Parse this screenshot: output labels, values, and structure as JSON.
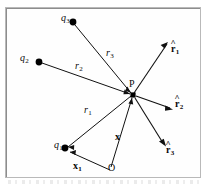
{
  "figure": {
    "frame": {
      "stroke": "#b9b9b9",
      "inner_stroke": "#8d8d8d",
      "background": "#fefefe"
    },
    "line_color": "#111111",
    "dot_color": "#000000"
  },
  "labels": {
    "q1": {
      "base": "q",
      "sub": "1",
      "x": 55,
      "y": 142
    },
    "q2": {
      "base": "q",
      "sub": "2",
      "x": 20,
      "y": 56
    },
    "q3": {
      "base": "q",
      "sub": "3",
      "x": 61,
      "y": 13
    },
    "r1": {
      "base": "r",
      "sub": "1",
      "x": 84,
      "y": 107
    },
    "r2": {
      "base": "r",
      "sub": "2",
      "x": 75,
      "y": 64
    },
    "r3": {
      "base": "r",
      "sub": "3",
      "x": 107,
      "y": 50
    },
    "rhat1": {
      "base": "r",
      "sub": "1",
      "hat": "^",
      "x": 173,
      "y": 48
    },
    "rhat2": {
      "base": "r",
      "sub": "2",
      "hat": "^",
      "x": 176,
      "y": 102
    },
    "rhat3": {
      "base": "r",
      "sub": "3",
      "hat": "^",
      "x": 168,
      "y": 148
    },
    "x_vec": {
      "base": "x",
      "sub": "",
      "x": 115,
      "y": 135
    },
    "x1_vec": {
      "base": "x",
      "sub": "1",
      "x": 74,
      "y": 163
    },
    "P": {
      "base": "P",
      "x": 129,
      "y": 82
    },
    "O": {
      "base": "O",
      "x": 108,
      "y": 164
    }
  },
  "points": {
    "P": {
      "x": 133,
      "y": 95,
      "label": "P",
      "radius": 2.6
    },
    "O": {
      "x": 112,
      "y": 171,
      "label": "O"
    },
    "q1": {
      "x": 65,
      "y": 148,
      "label": "q1",
      "radius": 3.2
    },
    "q2": {
      "x": 39,
      "y": 62,
      "label": "q2",
      "radius": 3.2
    },
    "q3": {
      "x": 73,
      "y": 22,
      "label": "q3",
      "radius": 3.2
    }
  },
  "vectors": [
    {
      "name": "r1",
      "from": "q1",
      "to": "P",
      "arrow_at": "q1",
      "label": "r1"
    },
    {
      "name": "r2",
      "from": "q2",
      "to": "P",
      "arrow_at": "P",
      "label": "r2"
    },
    {
      "name": "r3",
      "from": "q3",
      "to": "P",
      "arrow_at": "P",
      "label": "r3"
    },
    {
      "name": "rhat1",
      "from": "P",
      "to": {
        "x": 168,
        "y": 43
      },
      "arrow_at": "tip",
      "label": "rhat1"
    },
    {
      "name": "rhat2",
      "from": "P",
      "to": {
        "x": 173,
        "y": 110
      },
      "arrow_at": "tip",
      "label": "rhat2"
    },
    {
      "name": "rhat3",
      "from": "P",
      "to": {
        "x": 166,
        "y": 146
      },
      "arrow_at": "tip",
      "label": "rhat3"
    },
    {
      "name": "x",
      "from": "O",
      "to": "P",
      "arrow_at": "P",
      "label": "x_vec"
    },
    {
      "name": "x1",
      "from": "O",
      "to": "q1",
      "arrow_at": "q1",
      "label": "x1_vec"
    }
  ]
}
